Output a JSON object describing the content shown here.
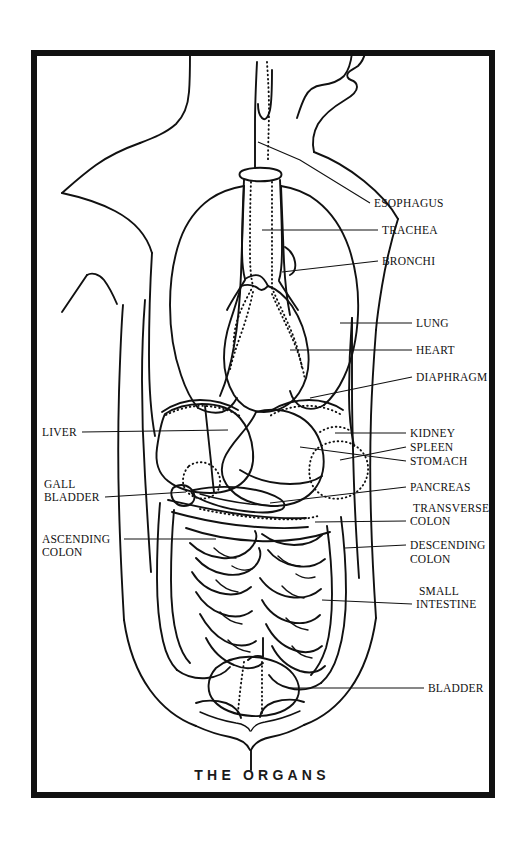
{
  "figure": {
    "title": "THE ORGANS",
    "caption_position": "bottom-center",
    "frame": {
      "color": "#111111",
      "x": 31,
      "y": 50,
      "width": 464,
      "height": 748
    },
    "background_color": "#ffffff",
    "ink_color": "#111111"
  },
  "labels": {
    "right": [
      {
        "id": "esophagus",
        "text": "ESOPHAGUS",
        "x": 374,
        "y": 207
      },
      {
        "id": "trachea",
        "text": "TRACHEA",
        "x": 382,
        "y": 234
      },
      {
        "id": "bronchi",
        "text": "BRONCHI",
        "x": 382,
        "y": 265
      },
      {
        "id": "lung",
        "text": "LUNG",
        "x": 416,
        "y": 327
      },
      {
        "id": "heart",
        "text": "HEART",
        "x": 416,
        "y": 354
      },
      {
        "id": "diaphragm",
        "text": "DIAPHRAGM",
        "x": 416,
        "y": 381
      },
      {
        "id": "kidney",
        "text": "KIDNEY",
        "x": 410,
        "y": 437
      },
      {
        "id": "spleen",
        "text": "SPLEEN",
        "x": 410,
        "y": 451
      },
      {
        "id": "stomach",
        "text": "STOMACH",
        "x": 410,
        "y": 465
      },
      {
        "id": "pancreas",
        "text": "PANCREAS",
        "x": 410,
        "y": 491
      },
      {
        "id": "transverse-colon-1",
        "text": "TRANSVERSE",
        "x": 413,
        "y": 512
      },
      {
        "id": "transverse-colon-2",
        "text": "COLON",
        "x": 410,
        "y": 525
      },
      {
        "id": "descending-colon-1",
        "text": "DESCENDING",
        "x": 410,
        "y": 549
      },
      {
        "id": "descending-colon-2",
        "text": "COLON",
        "x": 410,
        "y": 563
      },
      {
        "id": "small-intestine-1",
        "text": "SMALL",
        "x": 419,
        "y": 595
      },
      {
        "id": "small-intestine-2",
        "text": "INTESTINE",
        "x": 416,
        "y": 608
      },
      {
        "id": "bladder",
        "text": "BLADDER",
        "x": 428,
        "y": 692
      }
    ],
    "left": [
      {
        "id": "liver",
        "text": "LIVER",
        "x": 42,
        "y": 436
      },
      {
        "id": "gall-bladder-1",
        "text": "GALL",
        "x": 44,
        "y": 488
      },
      {
        "id": "gall-bladder-2",
        "text": "BLADDER",
        "x": 44,
        "y": 501
      },
      {
        "id": "ascending-colon-1",
        "text": "ASCENDING",
        "x": 42,
        "y": 543
      },
      {
        "id": "ascending-colon-2",
        "text": "COLON",
        "x": 42,
        "y": 556
      }
    ]
  },
  "organ_parts": [
    "head-chin",
    "neck",
    "shoulders",
    "arms",
    "torso-outline",
    "trachea",
    "esophagus",
    "bronchi",
    "left-lung",
    "right-lung",
    "heart",
    "diaphragm",
    "liver",
    "stomach",
    "spleen",
    "kidneys",
    "pancreas",
    "gall-bladder",
    "transverse-colon",
    "ascending-colon",
    "descending-colon",
    "small-intestine",
    "bladder",
    "pelvis"
  ]
}
